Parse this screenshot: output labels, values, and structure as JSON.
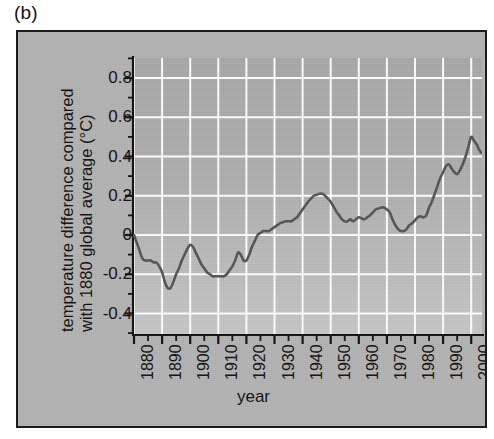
{
  "figure": {
    "panel_label": "(b)",
    "background_color": "#b4b4b4",
    "frame_color": "#1b1b1b",
    "gridline_color": "#ffffff",
    "line_color": "#545454"
  },
  "chart_data": {
    "type": "line",
    "title": "",
    "xlabel": "year",
    "ylabel": "temperature difference compared with 1880 global average (°C)",
    "ylabel_line1": "temperature difference compared",
    "ylabel_line2": "with 1880 global average (°C)",
    "xlim": [
      1878,
      2006
    ],
    "ylim": [
      -0.5,
      0.9
    ],
    "xticks": [
      1880,
      1890,
      1900,
      1910,
      1920,
      1930,
      1940,
      1950,
      1960,
      1970,
      1980,
      1990,
      2000
    ],
    "xtick_labels": [
      "1880",
      "1890",
      "1900",
      "1910",
      "1920",
      "1930",
      "1940",
      "1950",
      "1960",
      "1970",
      "1980",
      "1990",
      "2000"
    ],
    "xtick_minor_step": 5,
    "yticks": [
      0.8,
      0.6,
      0.4,
      0.2,
      0,
      -0.2,
      -0.4
    ],
    "ytick_labels": [
      "0.8",
      "0.6",
      "0.4",
      "0.2",
      "0",
      "-0.2",
      "-0.4"
    ],
    "ytick_minor_step": 0.1,
    "grid": true,
    "grid_axes": "both",
    "legend": "none",
    "series": [
      {
        "name": "global mean temperature anomaly relative to 1880",
        "x": [
          1880,
          1882,
          1884,
          1886,
          1888,
          1890,
          1891,
          1893,
          1895,
          1897,
          1899,
          1900,
          1902,
          1904,
          1906,
          1908,
          1910,
          1912,
          1914,
          1916,
          1917,
          1918,
          1920,
          1922,
          1924,
          1926,
          1928,
          1930,
          1932,
          1934,
          1936,
          1938,
          1940,
          1942,
          1944,
          1946,
          1948,
          1950,
          1952,
          1954,
          1956,
          1958,
          1960,
          1962,
          1964,
          1966,
          1968,
          1970,
          1972,
          1974,
          1976,
          1978,
          1980,
          1982,
          1984,
          1986,
          1988,
          1990,
          1992,
          1994,
          1996,
          1998,
          2000,
          2002,
          2004,
          2005
        ],
        "y": [
          0.0,
          -0.06,
          -0.13,
          -0.13,
          -0.14,
          -0.19,
          -0.25,
          -0.27,
          -0.21,
          -0.13,
          -0.07,
          -0.05,
          -0.09,
          -0.15,
          -0.19,
          -0.21,
          -0.21,
          -0.21,
          -0.18,
          -0.13,
          -0.09,
          -0.13,
          -0.13,
          -0.06,
          0.0,
          0.02,
          0.02,
          0.04,
          0.06,
          0.07,
          0.07,
          0.09,
          0.13,
          0.17,
          0.2,
          0.21,
          0.2,
          0.17,
          0.12,
          0.08,
          0.07,
          0.07,
          0.09,
          0.08,
          0.1,
          0.13,
          0.14,
          0.13,
          0.08,
          0.03,
          0.02,
          0.06,
          0.09,
          0.09,
          0.14,
          0.21,
          0.29,
          0.35,
          0.34,
          0.31,
          0.4,
          0.5,
          0.46,
          0.42,
          0.55,
          0.58
        ],
        "units": "°C"
      }
    ],
    "series_extra_points": {
      "note": "high-resolution traced path used for rendering",
      "x": [
        1880,
        1881,
        1882,
        1883,
        1884,
        1885,
        1886,
        1887,
        1888,
        1889,
        1890,
        1891,
        1892,
        1893,
        1894,
        1895,
        1896,
        1897,
        1898,
        1899,
        1900,
        1901,
        1902,
        1903,
        1904,
        1905,
        1906,
        1907,
        1908,
        1909,
        1910,
        1911,
        1912,
        1913,
        1914,
        1915,
        1916,
        1917,
        1918,
        1919,
        1920,
        1921,
        1922,
        1923,
        1924,
        1925,
        1926,
        1927,
        1928,
        1929,
        1930,
        1931,
        1932,
        1933,
        1934,
        1935,
        1936,
        1937,
        1938,
        1939,
        1940,
        1941,
        1942,
        1943,
        1944,
        1945,
        1946,
        1947,
        1948,
        1949,
        1950,
        1951,
        1952,
        1953,
        1954,
        1955,
        1956,
        1957,
        1958,
        1959,
        1960,
        1961,
        1962,
        1963,
        1964,
        1965,
        1966,
        1967,
        1968,
        1969,
        1970,
        1971,
        1972,
        1973,
        1974,
        1975,
        1976,
        1977,
        1978,
        1979,
        1980,
        1981,
        1982,
        1983,
        1984,
        1985,
        1986,
        1987,
        1988,
        1989,
        1990,
        1991,
        1992,
        1993,
        1994,
        1995,
        1996,
        1997,
        1998,
        1999,
        2000,
        2001,
        2002,
        2003,
        2004,
        2005
      ],
      "y": [
        0.0,
        -0.04,
        -0.08,
        -0.12,
        -0.13,
        -0.13,
        -0.13,
        -0.14,
        -0.14,
        -0.16,
        -0.19,
        -0.24,
        -0.27,
        -0.27,
        -0.24,
        -0.2,
        -0.17,
        -0.13,
        -0.1,
        -0.07,
        -0.05,
        -0.06,
        -0.09,
        -0.12,
        -0.15,
        -0.17,
        -0.19,
        -0.2,
        -0.21,
        -0.21,
        -0.21,
        -0.21,
        -0.21,
        -0.2,
        -0.18,
        -0.16,
        -0.13,
        -0.09,
        -0.1,
        -0.13,
        -0.13,
        -0.1,
        -0.06,
        -0.03,
        0.0,
        0.01,
        0.02,
        0.02,
        0.02,
        0.03,
        0.04,
        0.05,
        0.06,
        0.065,
        0.07,
        0.07,
        0.07,
        0.08,
        0.09,
        0.11,
        0.13,
        0.15,
        0.17,
        0.185,
        0.2,
        0.205,
        0.21,
        0.21,
        0.2,
        0.185,
        0.17,
        0.145,
        0.12,
        0.1,
        0.08,
        0.07,
        0.07,
        0.08,
        0.07,
        0.08,
        0.09,
        0.085,
        0.08,
        0.09,
        0.1,
        0.115,
        0.13,
        0.135,
        0.14,
        0.14,
        0.13,
        0.115,
        0.08,
        0.05,
        0.03,
        0.02,
        0.02,
        0.03,
        0.05,
        0.06,
        0.075,
        0.09,
        0.095,
        0.09,
        0.1,
        0.14,
        0.17,
        0.21,
        0.25,
        0.29,
        0.32,
        0.35,
        0.36,
        0.34,
        0.32,
        0.31,
        0.33,
        0.36,
        0.4,
        0.45,
        0.5,
        0.48,
        0.46,
        0.43,
        0.42,
        0.47,
        0.55,
        0.58
      ]
    }
  }
}
